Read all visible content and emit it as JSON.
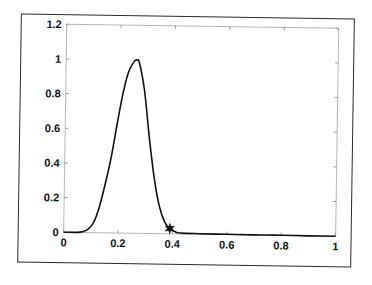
{
  "chart_data": {
    "type": "line",
    "title": "",
    "xlabel": "",
    "ylabel": "",
    "xlim": [
      0,
      1
    ],
    "ylim": [
      0,
      1.2
    ],
    "grid": false,
    "legend": null,
    "x_ticks": [
      "0",
      "0.2",
      "0.4",
      "0.6",
      "0.8",
      "1"
    ],
    "y_ticks": [
      "0",
      "0.2",
      "0.4",
      "0.6",
      "0.8",
      "1",
      "1.2"
    ],
    "series": [
      {
        "name": "curve",
        "color": "#111111",
        "x": [
          0,
          0.05,
          0.07,
          0.09,
          0.11,
          0.13,
          0.15,
          0.17,
          0.19,
          0.21,
          0.23,
          0.25,
          0.26,
          0.27,
          0.29,
          0.31,
          0.33,
          0.35,
          0.37,
          0.39,
          0.41,
          0.43,
          0.5,
          0.6,
          0.7,
          0.8,
          0.9,
          1.0
        ],
        "y": [
          0,
          0,
          0.005,
          0.02,
          0.06,
          0.15,
          0.28,
          0.43,
          0.62,
          0.8,
          0.93,
          0.99,
          1.0,
          0.98,
          0.82,
          0.55,
          0.32,
          0.16,
          0.07,
          0.03,
          0.012,
          0.005,
          0.003,
          0.002,
          0.001,
          0.001,
          0.0,
          0.0
        ]
      }
    ],
    "annotations": [
      {
        "type": "marker",
        "symbol": "star",
        "x": 0.39,
        "y": 0.03,
        "color": "#111111"
      }
    ]
  }
}
